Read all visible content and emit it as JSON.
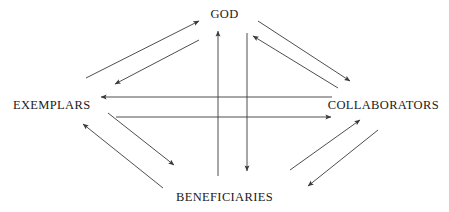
{
  "diagram": {
    "background_color": "#ffffff",
    "line_color": "#3a3a3a",
    "text_color": "#1a1a1a",
    "nodes": [
      {
        "id": "god",
        "label": "GOD",
        "position": "top"
      },
      {
        "id": "exemplars",
        "label": "EXEMPLARS",
        "position": "left"
      },
      {
        "id": "collaborators",
        "label": "COLLABORATORS",
        "position": "right"
      },
      {
        "id": "beneficiaries",
        "label": "BENEFICIARIES",
        "position": "bottom"
      }
    ],
    "connections": [
      {
        "from": "exemplars",
        "to": "god",
        "style": "diagonal",
        "quadrant": "upper-left",
        "direction": "up-right"
      },
      {
        "from": "god",
        "to": "exemplars",
        "style": "diagonal",
        "quadrant": "upper-left",
        "direction": "down-left"
      },
      {
        "from": "god",
        "to": "collaborators",
        "style": "diagonal",
        "quadrant": "upper-right",
        "direction": "down-right"
      },
      {
        "from": "collaborators",
        "to": "god",
        "style": "diagonal",
        "quadrant": "upper-right",
        "direction": "up-left"
      },
      {
        "from": "collaborators",
        "to": "exemplars",
        "style": "horizontal",
        "direction": "left"
      },
      {
        "from": "exemplars",
        "to": "collaborators",
        "style": "horizontal",
        "direction": "right"
      },
      {
        "from": "beneficiaries",
        "to": "god",
        "style": "vertical",
        "direction": "up"
      },
      {
        "from": "god",
        "to": "beneficiaries",
        "style": "vertical",
        "direction": "down"
      },
      {
        "from": "exemplars",
        "to": "beneficiaries",
        "style": "diagonal",
        "quadrant": "lower-left",
        "direction": "down-right"
      },
      {
        "from": "beneficiaries",
        "to": "exemplars",
        "style": "diagonal",
        "quadrant": "lower-left",
        "direction": "up-left"
      },
      {
        "from": "beneficiaries",
        "to": "collaborators",
        "style": "diagonal",
        "quadrant": "lower-right",
        "direction": "up-right"
      },
      {
        "from": "collaborators",
        "to": "beneficiaries",
        "style": "diagonal",
        "quadrant": "lower-right",
        "direction": "down-left"
      }
    ]
  }
}
